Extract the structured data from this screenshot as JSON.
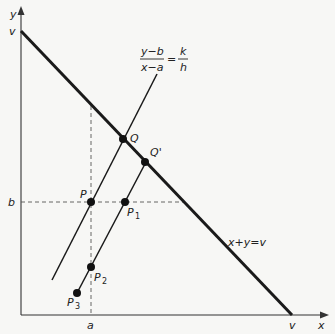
{
  "diagram": {
    "axes": {
      "x_label": "x",
      "y_label": "y",
      "x_intercept_label": "v",
      "y_intercept_label": "v",
      "a_label": "a",
      "b_label": "b"
    },
    "budget_line": {
      "label": "x+y=v"
    },
    "ray_equation": {
      "lhs_numerator": "y−b",
      "lhs_denominator": "x−a",
      "equals": "=",
      "rhs_numerator": "k",
      "rhs_denominator": "h"
    },
    "points": [
      {
        "id": "P",
        "label": "P",
        "sub": ""
      },
      {
        "id": "Q",
        "label": "Q",
        "sub": ""
      },
      {
        "id": "Qprime",
        "label": "Q'",
        "sub": ""
      },
      {
        "id": "P1",
        "label": "P",
        "sub": "1"
      },
      {
        "id": "P2",
        "label": "P",
        "sub": "2"
      },
      {
        "id": "P3",
        "label": "P",
        "sub": "3"
      }
    ]
  }
}
